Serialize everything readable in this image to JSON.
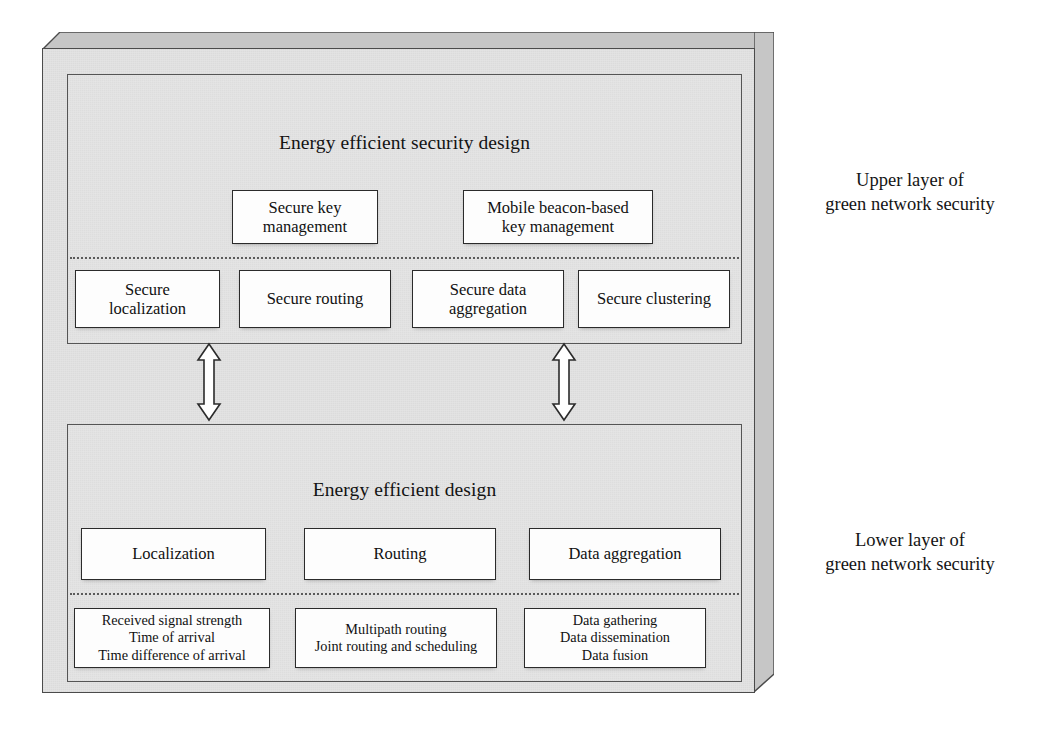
{
  "figure": {
    "background_color": "#ffffff",
    "slab_face_color": "#e3e3e3",
    "slab_shade_color": "#bfbfbf",
    "node_fill_color": "#fdfdfd",
    "line_color": "#2b2b2b"
  },
  "upper_layer": {
    "panel_title": "Energy efficient security design",
    "caption_line1": "Upper layer of",
    "caption_line2": "green network security",
    "top_row": [
      {
        "line1": "Secure key",
        "line2": "management"
      },
      {
        "line1": "Mobile beacon-based",
        "line2": "key management"
      }
    ],
    "bottom_row": [
      {
        "line1": "Secure",
        "line2": "localization"
      },
      {
        "line1": "Secure routing",
        "line2": ""
      },
      {
        "line1": "Secure data",
        "line2": "aggregation"
      },
      {
        "line1": "Secure clustering",
        "line2": ""
      }
    ]
  },
  "lower_layer": {
    "panel_title": "Energy efficient design",
    "caption_line1": "Lower layer of",
    "caption_line2": "green network security",
    "top_row": [
      {
        "line1": "Localization",
        "line2": "",
        "line3": ""
      },
      {
        "line1": "Routing",
        "line2": "",
        "line3": ""
      },
      {
        "line1": "Data aggregation",
        "line2": "",
        "line3": ""
      }
    ],
    "bottom_row": [
      {
        "line1": "Received signal strength",
        "line2": "Time of arrival",
        "line3": "Time difference of arrival"
      },
      {
        "line1": "Multipath routing",
        "line2": "Joint routing and scheduling",
        "line3": ""
      },
      {
        "line1": "Data gathering",
        "line2": "Data dissemination",
        "line3": "Data fusion"
      }
    ]
  },
  "connectors": [
    {
      "name": "link-left",
      "kind": "double-headed-vertical-arrow"
    },
    {
      "name": "link-right",
      "kind": "double-headed-vertical-arrow"
    }
  ]
}
